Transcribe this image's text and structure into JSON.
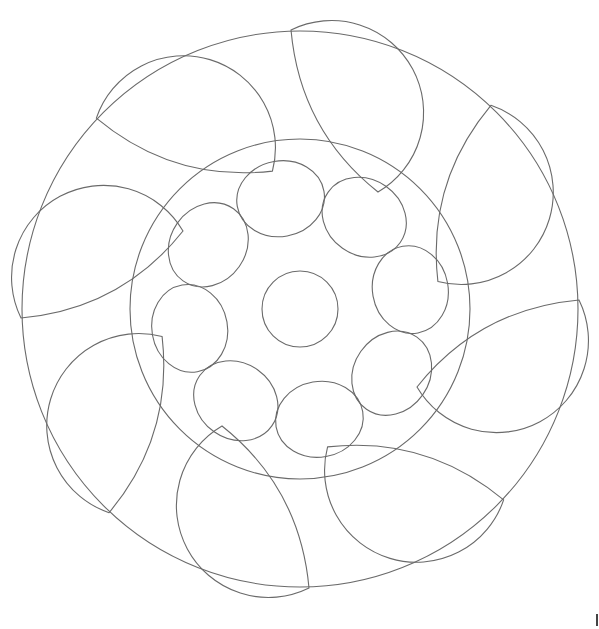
{
  "drawing": {
    "title": "Mandala line drawing",
    "stroke_color": "#6a6a6a",
    "background": "#ffffff",
    "center": [
      300,
      309
    ],
    "outer_circle_radius": 278,
    "inner_circle_radius": 170,
    "center_circle_radius": 38,
    "petal_count": 8,
    "petal_rotation_step_deg": 45,
    "small_circle_count": 8,
    "small_circle_orbit_radius": 112,
    "small_circle_radius": 44
  }
}
